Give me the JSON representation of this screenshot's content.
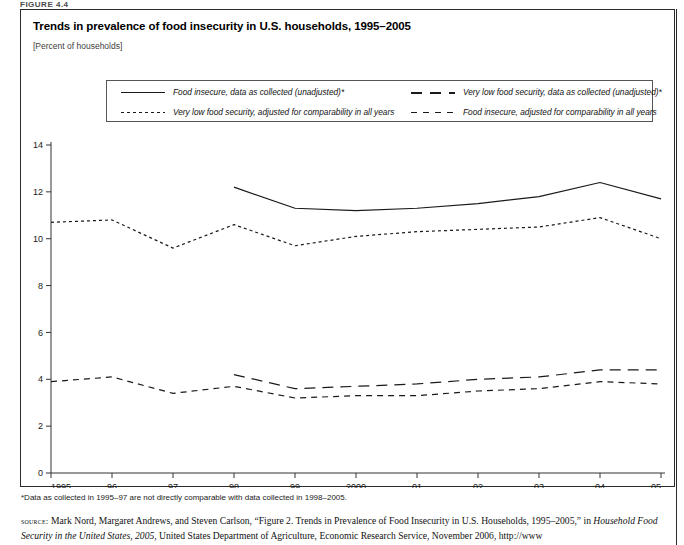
{
  "figure": {
    "label": "FIGURE 4.4",
    "title": "Trends in prevalence of food insecurity in U.S. households, 1995–2005",
    "subtitle": "[Percent of households]"
  },
  "legend": {
    "position": "top-inside",
    "items": [
      {
        "label": "Food insecure, data as collected (unadjusted)*",
        "style": "solid"
      },
      {
        "label": "Very low food security, data as collected (unadjusted)*",
        "style": "long-dash"
      },
      {
        "label": "Very low food security, adjusted for comparability in all years",
        "style": "dotted"
      },
      {
        "label": "Food insecure, adjusted for comparability in all years",
        "style": "medium-dash"
      }
    ]
  },
  "footnote": "*Data as collected in 1995–97 are not directly comparable with data collected in 1998–2005.",
  "source": {
    "kicker": "source:",
    "line1_a": " Mark Nord, Margaret Andrews, and Steven Carlson, “Figure 2. Trends in Prevalence of Food Insecurity in U.S. Households, 1995–2005,” in ",
    "line2_italic": "Household Food Security in the United States, 2005",
    "line2_rest": ", United States Department of Agriculture, Economic Research Service, November 2006, http://www"
  },
  "chart_data": {
    "type": "line",
    "title": "Trends in prevalence of food insecurity in U.S. households, 1995–2005",
    "xlabel": "",
    "ylabel": "Percent of households",
    "grid": false,
    "legend_position": "top",
    "x": [
      "1995",
      "96",
      "97",
      "98",
      "99",
      "2000",
      "01",
      "02",
      "03",
      "04",
      "05"
    ],
    "xtick_labels": [
      "1995",
      "96",
      "97",
      "98",
      "99",
      "2000",
      "01",
      "02",
      "03",
      "04",
      "05"
    ],
    "ytick_labels": [
      "0",
      "2",
      "4",
      "6",
      "8",
      "10",
      "12",
      "14"
    ],
    "ylim": [
      0,
      14
    ],
    "ytick_step": 2,
    "series": [
      {
        "name": "Food insecure, data as collected (unadjusted)*",
        "style": "solid",
        "x": [
          "98",
          "99",
          "2000",
          "01",
          "02",
          "03",
          "04",
          "05"
        ],
        "values": [
          12.2,
          11.3,
          11.2,
          11.3,
          11.5,
          11.8,
          12.4,
          11.7
        ]
      },
      {
        "name": "Very low food security, data as collected (unadjusted)*",
        "style": "long-dash",
        "x": [
          "98",
          "99",
          "2000",
          "01",
          "02",
          "03",
          "04",
          "05"
        ],
        "values": [
          4.2,
          3.6,
          3.7,
          3.8,
          4.0,
          4.1,
          4.4,
          4.4
        ]
      },
      {
        "name": "Very low food security, adjusted for comparability in all years",
        "style": "dotted",
        "x": [
          "1995",
          "96",
          "97",
          "98",
          "99",
          "2000",
          "01",
          "02",
          "03",
          "04",
          "05"
        ],
        "values": [
          10.7,
          10.8,
          9.6,
          10.6,
          9.7,
          10.1,
          10.3,
          10.4,
          10.5,
          10.9,
          10.0
        ]
      },
      {
        "name": "Food insecure, adjusted for comparability in all years",
        "style": "medium-dash",
        "x": [
          "1995",
          "96",
          "97",
          "98",
          "99",
          "2000",
          "01",
          "02",
          "03",
          "04",
          "05"
        ],
        "values": [
          3.9,
          4.1,
          3.4,
          3.7,
          3.2,
          3.3,
          3.3,
          3.5,
          3.6,
          3.9,
          3.8
        ]
      }
    ]
  },
  "axis": {
    "y_ticks": [
      14,
      12,
      10,
      8,
      6,
      4,
      2,
      0
    ],
    "x_ticks": [
      "1995",
      "96",
      "97",
      "98",
      "99",
      "2000",
      "01",
      "02",
      "03",
      "04",
      "05"
    ]
  }
}
